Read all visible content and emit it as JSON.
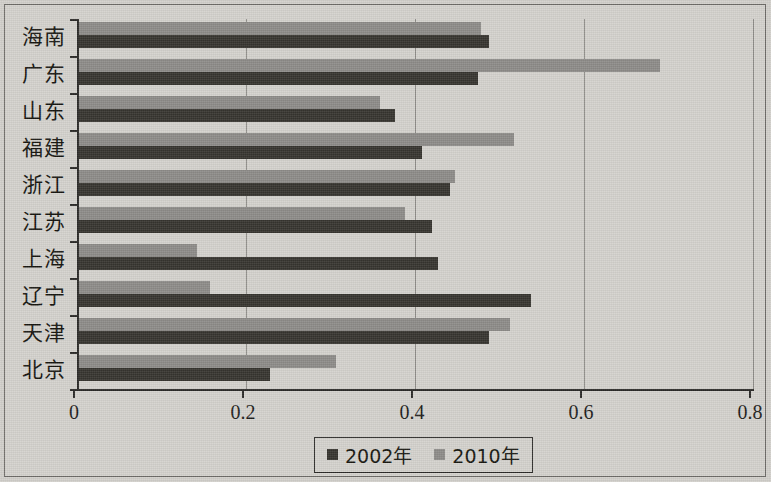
{
  "chart_data": {
    "type": "bar",
    "orientation": "horizontal",
    "title": "",
    "xlabel": "",
    "ylabel": "",
    "xlim": [
      0,
      0.8
    ],
    "xticks": [
      "0",
      "0.2",
      "0.4",
      "0.6",
      "0.8"
    ],
    "xtick_values": [
      0,
      0.2,
      0.4,
      0.6,
      0.8
    ],
    "grid": true,
    "grid_axis": "x",
    "legend_position": "bottom-center",
    "categories": [
      "海南",
      "广东",
      "山东",
      "福建",
      "浙江",
      "江苏",
      "上海",
      "辽宁",
      "天津",
      "北京"
    ],
    "series": [
      {
        "name": "2002年",
        "color": "#36342f",
        "values": [
          0.487,
          0.475,
          0.376,
          0.408,
          0.441,
          0.42,
          0.427,
          0.537,
          0.487,
          0.228
        ]
      },
      {
        "name": "2010年",
        "color": "#8d8b88",
        "values": [
          0.478,
          0.69,
          0.358,
          0.517,
          0.447,
          0.388,
          0.142,
          0.157,
          0.512,
          0.306
        ]
      }
    ]
  },
  "legend": {
    "items": [
      {
        "label": "2002年",
        "color": "#36342f"
      },
      {
        "label": "2010年",
        "color": "#8d8b88"
      }
    ]
  },
  "axis": {
    "x_tick_labels": [
      "0",
      "0.2",
      "0.4",
      "0.6",
      "0.8"
    ],
    "y_category_labels": [
      "海南",
      "广东",
      "山东",
      "福建",
      "浙江",
      "江苏",
      "上海",
      "辽宁",
      "天津",
      "北京"
    ]
  }
}
